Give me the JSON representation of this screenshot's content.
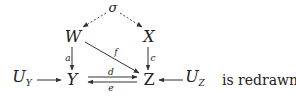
{
  "diagram": {
    "nodes": {
      "sigma": "σ",
      "W": "W",
      "X": "X",
      "Y": "Y",
      "Z": "Z",
      "UY_main": "U",
      "UY_sub": "Y",
      "UZ_main": "U",
      "UZ_sub": "Z"
    },
    "edge_labels": {
      "a": "a",
      "c": "c",
      "f": "f",
      "d": "d",
      "e": "e"
    },
    "edges": [
      {
        "from": "σ",
        "to": "W",
        "style": "dashed"
      },
      {
        "from": "σ",
        "to": "X",
        "style": "dashed"
      },
      {
        "from": "W",
        "to": "Y",
        "label": "a"
      },
      {
        "from": "X",
        "to": "Z",
        "label": "c"
      },
      {
        "from": "W",
        "to": "Z",
        "label": "f"
      },
      {
        "from": "Y",
        "to": "Z",
        "label": "d"
      },
      {
        "from": "Z",
        "to": "Y",
        "label": "e"
      },
      {
        "from": "U_Y",
        "to": "Y"
      },
      {
        "from": "U_Z",
        "to": "Z"
      }
    ],
    "trailing_text": "is redrawn"
  }
}
